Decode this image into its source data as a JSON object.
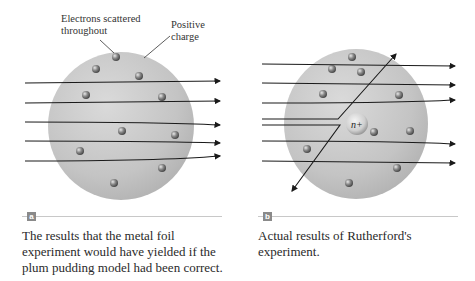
{
  "panel_a": {
    "label": "a",
    "callouts": {
      "electrons": "Electrons scattered throughout",
      "positive": "Positive charge"
    },
    "caption": "The results that the metal foil experiment would have yielded if the plum pudding model had been correct."
  },
  "panel_b": {
    "label": "b",
    "nucleus_label": "n+",
    "caption": "Actual results of Rutherford's experiment."
  },
  "colors": {
    "sphere": "#c4c4c4",
    "arrow": "#1a1a1a",
    "electron": "#7a7a7a",
    "badge": "#8a8a8a"
  }
}
